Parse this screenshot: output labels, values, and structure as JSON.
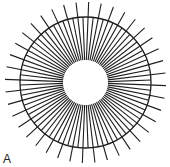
{
  "figure": {
    "panel_label": "A",
    "center": {
      "x": 85.5,
      "y": 82.5
    },
    "inner_hole_radius": 22.5,
    "outer_circle_radius": 65.5,
    "long_line_outer_radius": 80.5,
    "inner_line_count": 80,
    "long_line_every": 2,
    "angle_offset_deg": 2.25,
    "stroke_color": "#1e1e1e",
    "outer_circle_width": 1.3,
    "radial_line_width": 1.1
  }
}
